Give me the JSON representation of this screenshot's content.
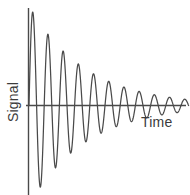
{
  "chart_data": {
    "type": "line",
    "title": "",
    "subtitle": "",
    "xlabel": "Time",
    "ylabel": "Signal",
    "legend": [],
    "grid": false,
    "axes": {
      "x_axis_visible": true,
      "y_axis_visible": true,
      "x_tick_labels": [],
      "y_tick_labels": [],
      "xlim": [
        0,
        10.5
      ],
      "ylim": [
        -1.35,
        1.35
      ]
    },
    "series": [
      {
        "name": "Damped oscillation",
        "color": "#4a4a4a",
        "model": "exponentially damped sine",
        "amplitude": 1.28,
        "decay_constant": 0.27,
        "period": 1.0,
        "phase_deg": 0,
        "peaks": [
          {
            "x": 0.25,
            "y": 1.2
          },
          {
            "x": 1.25,
            "y": 0.92
          },
          {
            "x": 2.25,
            "y": 0.7
          },
          {
            "x": 3.25,
            "y": 0.53
          },
          {
            "x": 4.25,
            "y": 0.41
          },
          {
            "x": 5.25,
            "y": 0.31
          },
          {
            "x": 6.25,
            "y": 0.24
          },
          {
            "x": 7.25,
            "y": 0.18
          },
          {
            "x": 8.25,
            "y": 0.14
          },
          {
            "x": 9.25,
            "y": 0.11
          }
        ],
        "troughs": [
          {
            "x": 0.75,
            "y": -1.05
          },
          {
            "x": 1.75,
            "y": -0.8
          },
          {
            "x": 2.75,
            "y": -0.61
          },
          {
            "x": 3.75,
            "y": -0.47
          },
          {
            "x": 4.75,
            "y": -0.36
          },
          {
            "x": 5.75,
            "y": -0.27
          },
          {
            "x": 6.75,
            "y": -0.21
          },
          {
            "x": 7.75,
            "y": -0.16
          },
          {
            "x": 8.75,
            "y": -0.12
          },
          {
            "x": 9.75,
            "y": -0.09
          }
        ]
      }
    ],
    "colors": {
      "background": "#ffffff",
      "axis": "#4a4a4a",
      "curve": "#4a4a4a",
      "label_text": "#3b3b3b"
    }
  }
}
